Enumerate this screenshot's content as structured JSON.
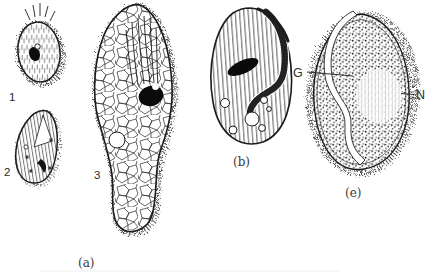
{
  "figure": {
    "background_color": "#ffffff",
    "ink_color": "#1c1c1c",
    "caption_color": "#3a3a3a"
  },
  "labels": {
    "organism1": "1",
    "organism2": "2",
    "organism3": "3",
    "panel_a": "(a)",
    "panel_b": "(b)",
    "panel_e": "(e)",
    "annotation_g": "G",
    "annotation_n": "N"
  }
}
